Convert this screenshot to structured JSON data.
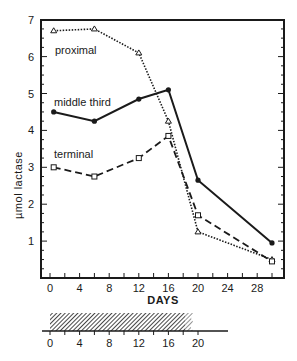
{
  "chart_data": {
    "type": "line",
    "title": "",
    "xlabel": "DAYS",
    "ylabel": "µmol lactase",
    "xlim": [
      -1,
      31
    ],
    "ylim": [
      0,
      7
    ],
    "x_ticks": [
      0,
      4,
      8,
      12,
      16,
      20,
      24,
      28
    ],
    "y_ticks": [
      1,
      2,
      3,
      4,
      5,
      6,
      7
    ],
    "grid": false,
    "legend": "inline labels",
    "series": [
      {
        "name": "proximal",
        "style": "dotted",
        "marker": "triangle",
        "x": [
          0.5,
          6,
          12,
          16,
          20,
          30
        ],
        "values": [
          6.7,
          6.75,
          6.1,
          4.25,
          1.25,
          0.5
        ]
      },
      {
        "name": "middle third",
        "style": "solid",
        "marker": "filled-circle",
        "x": [
          0.5,
          6,
          12,
          16,
          20,
          30
        ],
        "values": [
          4.5,
          4.25,
          4.85,
          5.1,
          2.65,
          0.95
        ]
      },
      {
        "name": "terminal",
        "style": "dashed",
        "marker": "open-square",
        "x": [
          0.5,
          6,
          12,
          16,
          20,
          30
        ],
        "values": [
          3.0,
          2.75,
          3.25,
          3.85,
          1.7,
          0.45
        ]
      }
    ],
    "timeline": {
      "x_ticks": [
        0,
        4,
        8,
        12,
        16,
        20
      ],
      "hatched_bar": {
        "start": 0,
        "end": 20,
        "fade_from": 18
      }
    }
  },
  "labels": {
    "proximal": "proximal",
    "middle": "middle third",
    "terminal": "terminal",
    "xaxis": "DAYS",
    "yaxis": "µmol lactase"
  },
  "ticks": {
    "x": [
      "0",
      "4",
      "8",
      "12",
      "16",
      "20",
      "24",
      "28"
    ],
    "y": [
      "1",
      "2",
      "3",
      "4",
      "5",
      "6",
      "7"
    ],
    "timeline": [
      "0",
      "4",
      "8",
      "12",
      "16",
      "20"
    ]
  },
  "colors": {
    "ink": "#1a1a1a",
    "background": "#ffffff"
  }
}
